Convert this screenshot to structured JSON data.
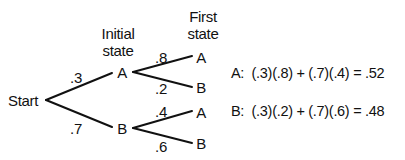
{
  "diagram": {
    "type": "probability-tree",
    "headers": {
      "initial_state_line1": "Initial",
      "initial_state_line2": "state",
      "first_state_line1": "First",
      "first_state_line2": "state"
    },
    "root": {
      "label": "Start"
    },
    "initial_states": [
      {
        "label": "A",
        "probability": ".3",
        "children": [
          {
            "label": "A",
            "probability": ".8"
          },
          {
            "label": "B",
            "probability": ".2"
          }
        ]
      },
      {
        "label": "B",
        "probability": ".7",
        "children": [
          {
            "label": "A",
            "probability": ".4"
          },
          {
            "label": "B",
            "probability": ".6"
          }
        ]
      }
    ],
    "equations": [
      {
        "label": "A:",
        "expression": "(.3)(.8) + (.7)(.4) = .52"
      },
      {
        "label": "B:",
        "expression": "(.3)(.2) + (.7)(.6) = .48"
      }
    ],
    "line_color": "#111111"
  }
}
